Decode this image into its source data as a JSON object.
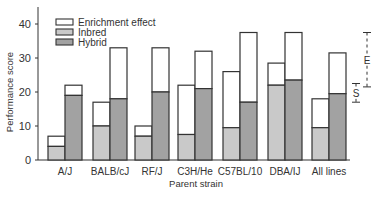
{
  "chart_data": {
    "type": "bar",
    "subtype": "stacked-grouped",
    "title": "",
    "xlabel": "Parent strain",
    "ylabel": "Performance score",
    "ylim": [
      0,
      45
    ],
    "yticks": [
      0,
      10,
      20,
      30,
      40
    ],
    "grid": false,
    "legend_position": "top-left",
    "categories": [
      "A/J",
      "BALB/cJ",
      "RF/J",
      "C3H/He",
      "C57BL/10",
      "DBA/IJ",
      "All lines"
    ],
    "series": [
      {
        "name": "Inbred",
        "base": [
          4,
          10,
          7,
          7.5,
          9.5,
          22,
          9.5
        ],
        "total_with_enrichment": [
          7,
          17,
          10,
          22,
          26,
          28.5,
          18
        ]
      },
      {
        "name": "Hybrid",
        "base": [
          19,
          18,
          20,
          21,
          17,
          23.5,
          19.5
        ],
        "total_with_enrichment": [
          22,
          33,
          33,
          32,
          37.5,
          37.5,
          31.5
        ]
      }
    ],
    "enrichment_effect": {
      "inbred": [
        3,
        7,
        3,
        14.5,
        16.5,
        6.5,
        8.5
      ],
      "hybrid": [
        3,
        15,
        13,
        11,
        20.5,
        14,
        12
      ]
    },
    "legend": [
      "Enrichment effect",
      "Inbred",
      "Hybrid"
    ],
    "annotations": [
      {
        "label": "E",
        "type": "error-bar",
        "range": [
          21.5,
          37.5
        ]
      },
      {
        "label": "S",
        "type": "error-bar",
        "range": [
          17,
          22.5
        ]
      }
    ]
  },
  "colors": {
    "enrichment": "#ffffff",
    "inbred": "#c9c9c9",
    "hybrid": "#a2a2a2",
    "stroke": "#333333"
  }
}
